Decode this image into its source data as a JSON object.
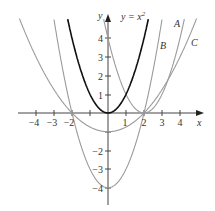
{
  "chart_data": {
    "type": "line",
    "title": "",
    "xlabel": "x",
    "ylabel": "y",
    "xlim": [
      -4.9,
      5.1
    ],
    "ylim": [
      -4.8,
      5.2
    ],
    "x_ticks": [
      "-4",
      "-3",
      "-2",
      "1",
      "2",
      "3",
      "4"
    ],
    "y_ticks": [
      "4",
      "3",
      "2",
      "1",
      "-2",
      "-3",
      "-4"
    ],
    "grid": false,
    "series": [
      {
        "name": "y = x²",
        "label": "y = x^2",
        "formula": "x^2",
        "color": "#111111",
        "width": 1.6
      },
      {
        "name": "A",
        "label": "A",
        "formula": "(x-2)^2",
        "color": "#9a9a9a",
        "width": 1.1
      },
      {
        "name": "B",
        "label": "B",
        "formula": "x^2-4",
        "color": "#9a9a9a",
        "width": 1.1
      },
      {
        "name": "C",
        "label": "C",
        "formula": "x^2/4-1",
        "color": "#9a9a9a",
        "width": 1.1
      }
    ]
  },
  "labels": {
    "x_axis": "x",
    "y_axis": "y",
    "main_curve": "y = x",
    "main_curve_exp": "2",
    "A": "A",
    "B": "B",
    "C": "C",
    "xt": {
      "m4": "−4",
      "m3": "−3",
      "m2": "−2",
      "p1": "1",
      "p2": "2",
      "p3": "3",
      "p4": "4"
    },
    "yt": {
      "p4": "4",
      "p3": "3",
      "p2": "2",
      "p1": "1",
      "m2": "−2",
      "m3": "−3",
      "m4": "−4"
    }
  }
}
